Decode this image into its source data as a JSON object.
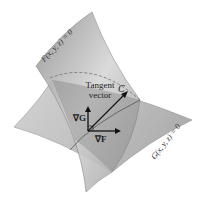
{
  "diagram": {
    "surfaces": [
      {
        "name": "F",
        "label": "F(x, y, z) = 0",
        "color": "#9a9a9a"
      },
      {
        "name": "G",
        "label": "G(x, y, z) = 0",
        "color": "#b8b8b8"
      }
    ],
    "curve_label": "C",
    "tangent_label_line1": "Tangent",
    "tangent_label_line2": "vector",
    "grad_g_label": "∇G",
    "grad_f_label": "∇F",
    "colors": {
      "background": "#ffffff",
      "arrow": "#111111",
      "dashed": "#777777"
    }
  }
}
